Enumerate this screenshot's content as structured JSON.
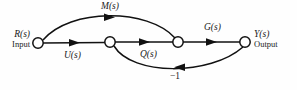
{
  "figure": {
    "type": "signal-flow-graph",
    "background_color": "#fefefe",
    "line_color": "#111111",
    "node_fill": "#ffffff"
  },
  "terminals": {
    "input": {
      "signal": "R(s)",
      "role": "Input"
    },
    "output": {
      "signal": "Y(s)",
      "role": "Output"
    }
  },
  "nodes": [
    {
      "id": "n1",
      "x": 38,
      "y": 43,
      "r": 5.2
    },
    {
      "id": "n2",
      "x": 110,
      "y": 42,
      "r": 5.2
    },
    {
      "id": "n3",
      "x": 178,
      "y": 42,
      "r": 5.2
    },
    {
      "id": "n4",
      "x": 245,
      "y": 42,
      "r": 5.2
    }
  ],
  "edges": [
    {
      "id": "e-m",
      "label": "M(s)",
      "from": "n1",
      "to": "n3",
      "shape": "arc-above",
      "direction": "forward"
    },
    {
      "id": "e-u",
      "label": "U(s)",
      "from": "n1",
      "to": "n2",
      "shape": "straight",
      "direction": "forward"
    },
    {
      "id": "e-mid",
      "label": "",
      "from": "n2",
      "to": "n3",
      "shape": "straight",
      "direction": "forward"
    },
    {
      "id": "e-g",
      "label": "G(s)",
      "from": "n3",
      "to": "n4",
      "shape": "straight",
      "direction": "forward"
    },
    {
      "id": "e-q",
      "label": "Q(s)",
      "from": "n2",
      "to": "n4",
      "shape": "arc-below",
      "direction": "forward-curved"
    },
    {
      "id": "e-fb",
      "label": "-1",
      "from": "n4",
      "to": "n2",
      "shape": "arc-below",
      "direction": "reverse"
    }
  ],
  "labels": {
    "m": "M(s)",
    "u": "U(s)",
    "q": "Q(s)",
    "g": "G(s)",
    "feedback": "−1"
  }
}
